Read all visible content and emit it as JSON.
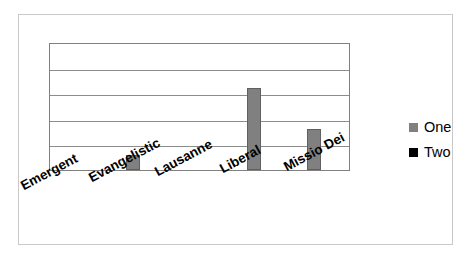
{
  "chart_data": {
    "type": "bar",
    "title": "",
    "subtitle": "",
    "xlabel": "",
    "ylabel": "",
    "categories": [
      "Emergent",
      "Evangelistic",
      "Lausanne",
      "Liberal",
      "Missio Dei"
    ],
    "series": [
      {
        "name": "One",
        "color": "#808080",
        "values": [
          0,
          0.12,
          0,
          0.64,
          0.32
        ]
      },
      {
        "name": "Two",
        "color": "#000000",
        "values": [
          0,
          0,
          0,
          0,
          0
        ]
      }
    ],
    "ylim": [
      0,
      1
    ],
    "y_tick_values": [
      0,
      0.2,
      0.4,
      0.6,
      0.8,
      1.0
    ],
    "y_tick_labels": [
      "",
      "",
      "",
      "",
      "",
      ""
    ],
    "gridlines": true,
    "gridline_count": 4,
    "legend_position": "right",
    "annotations": []
  },
  "legend": {
    "entries": [
      {
        "label": "One",
        "color": "#808080",
        "marker": "square-swatch"
      },
      {
        "label": "Two",
        "color": "#000000",
        "marker": "square-swatch"
      }
    ]
  },
  "axis": {
    "x_labels": [
      "Emergent",
      "Evangelistic",
      "Lausanne",
      "Liberal",
      "Missio Dei"
    ],
    "x_label_rotation": "-28"
  },
  "colors": {
    "series_one": "#808080",
    "series_two": "#000000",
    "plot_border": "#808080",
    "gridline": "#8c8c8c",
    "chart_border": "#c9c9c9",
    "background": "#ffffff"
  }
}
